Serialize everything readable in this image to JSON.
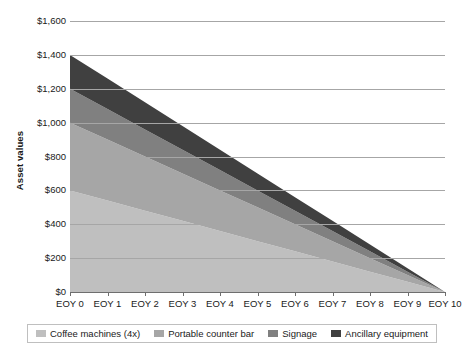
{
  "chart_data": {
    "type": "area",
    "stacked": true,
    "title": "",
    "subtitle": "",
    "xlabel": "",
    "ylabel": "Asset values",
    "categories": [
      "EOY 0",
      "EOY 1",
      "EOY 2",
      "EOY 3",
      "EOY 4",
      "EOY 5",
      "EOY 6",
      "EOY 7",
      "EOY 8",
      "EOY 9",
      "EOY 10"
    ],
    "x": [
      0,
      1,
      2,
      3,
      4,
      5,
      6,
      7,
      8,
      9,
      10
    ],
    "ylim": [
      0,
      1600
    ],
    "ytick_step": 200,
    "ytick_labels": [
      "$1,600",
      "$1,400",
      "$1,200",
      "$1,000",
      "$800",
      "$600",
      "$400",
      "$200",
      "$0"
    ],
    "ytick_values": [
      1600,
      1400,
      1200,
      1000,
      800,
      600,
      400,
      200,
      0
    ],
    "grid": true,
    "grid_axis": "y",
    "legend_position": "bottom",
    "total_at_eoy0": 1400,
    "total_at_eoy10": 0,
    "series": [
      {
        "name": "Coffee machines (4x)",
        "color": "#bfbfbf",
        "values": [
          600,
          540,
          480,
          420,
          360,
          300,
          240,
          180,
          120,
          60,
          0
        ]
      },
      {
        "name": "Portable counter bar",
        "color": "#a6a6a6",
        "values": [
          400,
          360,
          320,
          280,
          240,
          200,
          160,
          120,
          80,
          40,
          0
        ]
      },
      {
        "name": "Signage",
        "color": "#808080",
        "values": [
          200,
          180,
          160,
          140,
          120,
          100,
          80,
          60,
          40,
          20,
          0
        ]
      },
      {
        "name": "Ancillary equipment",
        "color": "#404040",
        "values": [
          200,
          180,
          160,
          140,
          120,
          100,
          80,
          60,
          40,
          20,
          0
        ]
      }
    ]
  },
  "legend": {
    "items": [
      {
        "label": "Coffee machines (4x)",
        "color": "#bfbfbf"
      },
      {
        "label": "Portable counter bar",
        "color": "#a6a6a6"
      },
      {
        "label": "Signage",
        "color": "#808080"
      },
      {
        "label": "Ancillary equipment",
        "color": "#404040"
      }
    ]
  },
  "colors": {
    "gridline": "#a6a6a6",
    "axis": "#6e6e6e",
    "text": "#1a1a1a",
    "background": "#ffffff",
    "legend_border": "#bfbfbf"
  }
}
